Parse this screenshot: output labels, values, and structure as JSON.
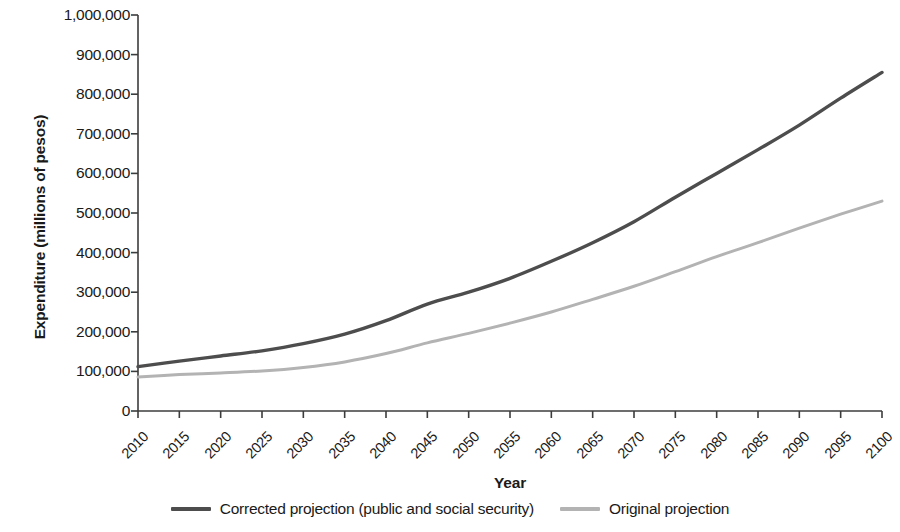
{
  "chart_data": {
    "type": "line",
    "title": "",
    "xlabel": "Year",
    "ylabel": "Expenditure (millions of pesos)",
    "xlim": [
      2010,
      2100
    ],
    "ylim": [
      0,
      1000000
    ],
    "grid": false,
    "legend_position": "bottom",
    "x_tick_labels": [
      "2010",
      "2015",
      "2020",
      "2025",
      "2030",
      "2035",
      "2040",
      "2045",
      "2050",
      "2055",
      "2060",
      "2065",
      "2070",
      "2075",
      "2080",
      "2085",
      "2090",
      "2095",
      "2100"
    ],
    "y_tick_labels": [
      "0",
      "100,000",
      "200,000",
      "300,000",
      "400,000",
      "500,000",
      "600,000",
      "700,000",
      "800,000",
      "900,000",
      "1,000,000"
    ],
    "y_tick_values": [
      0,
      100000,
      200000,
      300000,
      400000,
      500000,
      600000,
      700000,
      800000,
      900000,
      1000000
    ],
    "x": [
      2010,
      2015,
      2020,
      2025,
      2030,
      2035,
      2040,
      2045,
      2050,
      2055,
      2060,
      2065,
      2070,
      2075,
      2080,
      2085,
      2090,
      2095,
      2100
    ],
    "series": [
      {
        "name": "Corrected projection (public and social security)",
        "color": "#4d4d4d",
        "values": [
          112000,
          126000,
          139000,
          152000,
          170000,
          194000,
          228000,
          270000,
          300000,
          335000,
          378000,
          425000,
          478000,
          540000,
          600000,
          660000,
          722000,
          790000,
          855000
        ]
      },
      {
        "name": "Original projection",
        "color": "#b3b3b3",
        "values": [
          86000,
          92000,
          96000,
          101000,
          110000,
          124000,
          145000,
          172000,
          196000,
          222000,
          250000,
          282000,
          315000,
          352000,
          390000,
          425000,
          462000,
          497000,
          530000
        ]
      }
    ]
  },
  "axis": {
    "y_title": "Expenditure (millions of pesos)",
    "x_title": "Year"
  },
  "legend": {
    "items": [
      {
        "label": "Corrected projection (public and social security)",
        "color": "#4d4d4d"
      },
      {
        "label": "Original projection",
        "color": "#b3b3b3"
      }
    ]
  },
  "colors": {
    "axis": "#3c3c3c",
    "text": "#1a1a1a",
    "background": "#ffffff",
    "series_corrected": "#4d4d4d",
    "series_original": "#b3b3b3"
  }
}
